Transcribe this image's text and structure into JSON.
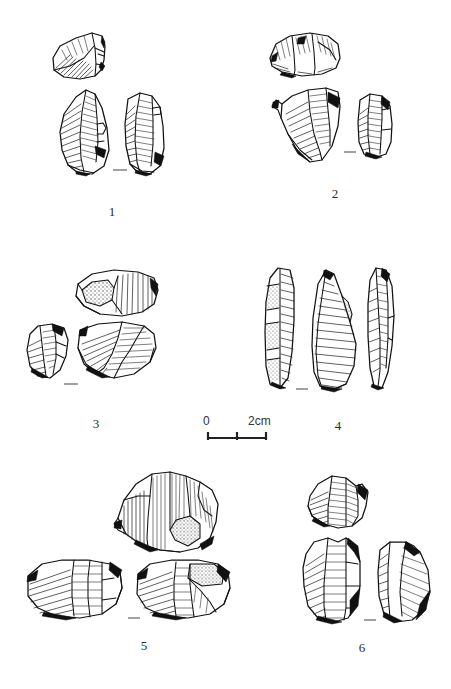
{
  "figure": {
    "kind": "archaeological-lithic-plate",
    "background_color": "#ffffff",
    "ink_color": "#111111",
    "specimen_count": 6,
    "caption": ""
  },
  "scale": {
    "zero_label": "0",
    "max_label": "2cm",
    "unit": "cm",
    "min_value": 0,
    "max_value": 2,
    "minor_tick_value": 1,
    "bar_length_px": 58
  },
  "specimens": [
    {
      "number": "1",
      "label": "1",
      "views": 3,
      "view_names": [
        "dorsal-top-fragment",
        "ventral-left-view",
        "lateral-right-view"
      ],
      "has_cortex": false,
      "has_tickmark": true
    },
    {
      "number": "2",
      "label": "2",
      "views": 3,
      "view_names": [
        "dorsal-top-fragment",
        "ventral-left-view",
        "lateral-right-view"
      ],
      "has_cortex": false,
      "has_tickmark": true
    },
    {
      "number": "3",
      "label": "3",
      "views": 3,
      "view_names": [
        "dorsal-top-view",
        "lateral-left-view",
        "ventral-right-view"
      ],
      "has_cortex": true,
      "has_tickmark": true
    },
    {
      "number": "4",
      "label": "4",
      "views": 3,
      "view_names": [
        "lateral-left-blade",
        "ventral-centre-blade",
        "lateral-right-blade"
      ],
      "has_cortex": true,
      "has_tickmark": true
    },
    {
      "number": "5",
      "label": "5",
      "views": 3,
      "view_names": [
        "dorsal-top-core",
        "ventral-left-view",
        "lateral-right-view"
      ],
      "has_cortex": true,
      "has_tickmark": true
    },
    {
      "number": "6",
      "label": "6",
      "views": 3,
      "view_names": [
        "dorsal-top-core",
        "ventral-left-view",
        "lateral-right-view"
      ],
      "has_cortex": false,
      "has_tickmark": true
    }
  ]
}
